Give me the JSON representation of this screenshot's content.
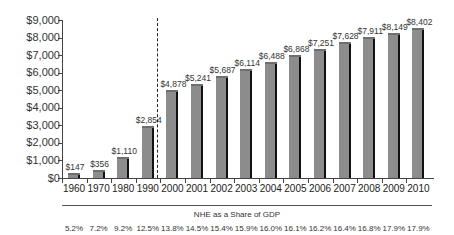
{
  "chart_data": {
    "type": "bar",
    "title": "",
    "xlabel": "",
    "ylabel": "",
    "ylim": [
      0,
      9000
    ],
    "y_ticks": [
      "$0",
      "$1,000",
      "$2,000",
      "$3,000",
      "$4,000",
      "$5,000",
      "$6,000",
      "$7,000",
      "$8,000",
      "$9,000"
    ],
    "categories": [
      "1960",
      "1970",
      "1980",
      "1990",
      "2000",
      "2001",
      "2002",
      "2003",
      "2004",
      "2005",
      "2006",
      "2007",
      "2008",
      "2009",
      "2010"
    ],
    "values": [
      147,
      356,
      1110,
      2854,
      4878,
      5241,
      5687,
      6114,
      6488,
      6868,
      7251,
      7628,
      7911,
      8149,
      8402
    ],
    "value_labels": [
      "$147",
      "$356",
      "$1,110",
      "$2,854",
      "$4,878",
      "$5,241",
      "$5,687",
      "$6,114",
      "$6,488",
      "$6,868",
      "$7,251",
      "$7,628",
      "$7,911",
      "$8,149",
      "$8,402"
    ],
    "annotations": [
      "Dashed vertical line separates decade data (1960-2000) from annual data (2001-2010)"
    ],
    "secondary_table": {
      "title": "NHE as a Share of GDP",
      "values": [
        "5.2%",
        "7.2%",
        "9.2%",
        "12.5%",
        "13.8%",
        "14.5%",
        "15.4%",
        "15.9%",
        "16.0%",
        "16.1%",
        "16.2%",
        "16.4%",
        "16.8%",
        "17.9%",
        "17.9%"
      ]
    },
    "grid": false,
    "legend": null,
    "colors": {
      "bar": "#8c8c8c",
      "bar_shadow": "#111111",
      "axis": "#444444"
    }
  }
}
